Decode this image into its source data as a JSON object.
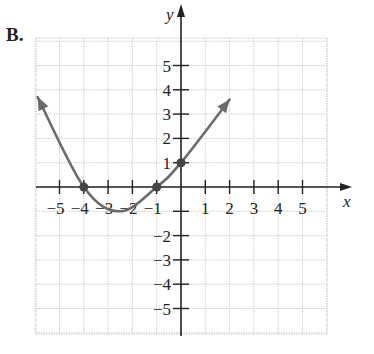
{
  "figure": {
    "option_label": "B."
  },
  "chart_data": {
    "type": "line",
    "title": "",
    "xlabel": "x",
    "ylabel": "y",
    "xlim": [
      -6,
      6
    ],
    "ylim": [
      -6,
      6
    ],
    "grid": true,
    "x_ticks": [
      -5,
      -4,
      -3,
      -2,
      -1,
      1,
      2,
      3,
      4,
      5
    ],
    "x_tick_labels": [
      "−5",
      "−4",
      "−3",
      "−2",
      "−1",
      "1",
      "2",
      "3",
      "4",
      "5"
    ],
    "y_ticks": [
      5,
      4,
      3,
      2,
      1,
      -2,
      -3,
      -4,
      -5
    ],
    "y_tick_labels": [
      "5",
      "4",
      "3",
      "2",
      "1",
      "−2",
      "−3",
      "−4",
      "−5"
    ],
    "series": [
      {
        "name": "parabola",
        "description": "Upward-opening parabola with arrows on both ends",
        "x": [
          -5.9,
          -4,
          -2.5,
          -1,
          0,
          2
        ],
        "y": [
          3.7,
          0,
          -1.0,
          0,
          1,
          3.6
        ],
        "color": "#6b6b6b"
      }
    ],
    "marked_points": [
      {
        "x": -4,
        "y": 0
      },
      {
        "x": -1,
        "y": 0
      },
      {
        "x": 0,
        "y": 1
      }
    ],
    "annotations": []
  }
}
